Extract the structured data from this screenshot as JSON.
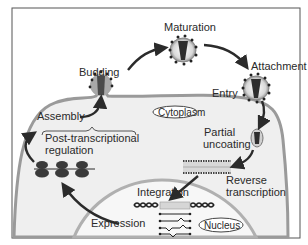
{
  "diagram": {
    "compartments": {
      "cytoplasm": "Cytoplasm",
      "nucleus": "Nucleus"
    },
    "stages": {
      "budding": "Budding",
      "maturation": "Maturation",
      "attachment": "Attachment",
      "entry": "Entry",
      "partial_uncoating_1": "Partial",
      "partial_uncoating_2": "uncoating",
      "reverse_transcription_1": "Reverse",
      "reverse_transcription_2": "transcription",
      "integration": "Integration",
      "expression": "Expression",
      "post_transcriptional_1": "Post-transcriptional",
      "post_transcriptional_2": "regulation",
      "assembly": "Assembly"
    },
    "colors": {
      "membrane": "#9a9a9a",
      "cell_fill": "#efefef",
      "nucleus_fill": "#f7f7f7",
      "virion_core": "#3a3a3a",
      "virion_capsid": "#a0a0a0",
      "arrow": "#2b2b2b",
      "frame": "#555555"
    }
  }
}
